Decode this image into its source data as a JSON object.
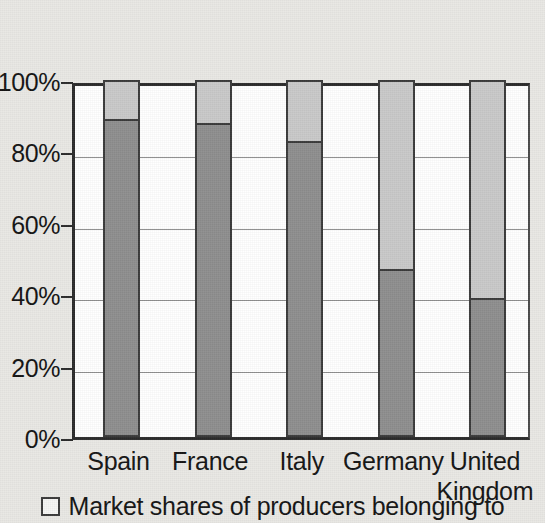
{
  "chart_data": {
    "type": "bar",
    "subtype": "100% stacked column",
    "title": "",
    "subtitle": "",
    "xlabel": "",
    "ylabel": "",
    "categories": [
      "Spain",
      "France",
      "Italy",
      "Germany",
      "United Kingdom"
    ],
    "category_label_lines": [
      [
        "Spain"
      ],
      [
        "France"
      ],
      [
        "Italy"
      ],
      [
        "Germany"
      ],
      [
        "United",
        "Kingdom"
      ]
    ],
    "series": [
      {
        "name": "Market shares of producers belonging to",
        "color": "#8e8e8e",
        "stack_position": "bottom",
        "values": [
          89,
          88,
          83,
          47,
          39
        ]
      },
      {
        "name": "remainder",
        "color": "#c9c9c9",
        "stack_position": "top",
        "values": [
          11,
          12,
          17,
          53,
          61
        ]
      }
    ],
    "ylim": [
      0,
      100
    ],
    "y_tick_values": [
      0,
      20,
      40,
      60,
      80,
      100
    ],
    "y_tick_labels": [
      "0%",
      "20%",
      "40%",
      "60%",
      "80%",
      "100%"
    ],
    "grid": true,
    "grid_axis": "y",
    "legend_position": "bottom",
    "value_unit": "%"
  },
  "axes": {
    "y_ticks": [
      {
        "label": "100%",
        "value": 100
      },
      {
        "label": "80%",
        "value": 80
      },
      {
        "label": "60%",
        "value": 60
      },
      {
        "label": "40%",
        "value": 40
      },
      {
        "label": "20%",
        "value": 20
      },
      {
        "label": "0%",
        "value": 0
      }
    ]
  },
  "legend": {
    "marker": "open-square-marker",
    "items": [
      {
        "label": "Market shares of producers belonging to"
      }
    ]
  },
  "colors": {
    "background": "#e9e8e4",
    "plot_background": "#ffffff",
    "axis": "#2b2b2b",
    "gridline": "#8f8f8f",
    "series_bottom": "#8e8e8e",
    "series_top": "#c9c9c9",
    "text": "#141414"
  }
}
